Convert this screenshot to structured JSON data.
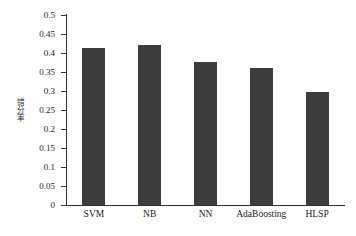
{
  "chart_data": {
    "type": "bar",
    "title": "",
    "xlabel": "",
    "ylabel": "错分率",
    "categories": [
      "SVM",
      "NB",
      "NN",
      "AdaBoosting",
      "HLSP"
    ],
    "values": [
      0.413,
      0.422,
      0.376,
      0.361,
      0.297
    ],
    "ylim": [
      0,
      0.5
    ],
    "ytick_labels": [
      "0",
      "0.05",
      "0.1",
      "0.15",
      "0.2",
      "0.25",
      "0.3",
      "0.35",
      "0.4",
      "0.45",
      "0.5"
    ],
    "ytick_values": [
      0,
      0.05,
      0.1,
      0.15,
      0.2,
      0.25,
      0.3,
      0.35,
      0.4,
      0.45,
      0.5
    ],
    "grid": false,
    "legend": null,
    "series": [
      {
        "name": "错分率",
        "values": [
          0.413,
          0.422,
          0.376,
          0.361,
          0.297
        ]
      }
    ],
    "colors": {
      "bar": "#3d3d3d",
      "axis": "#333333",
      "text": "#1c1c1c",
      "background": "#ffffff"
    }
  }
}
